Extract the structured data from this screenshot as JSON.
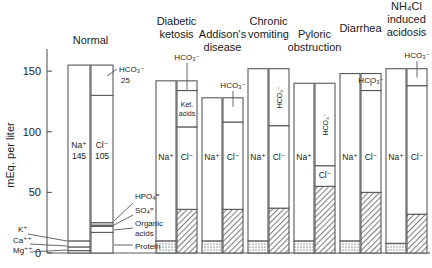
{
  "axis": {
    "title": "mEq. per liter",
    "ticks": [
      0,
      50,
      100,
      150
    ],
    "max": 160,
    "min": 0
  },
  "labels": {
    "hco3": "HCO₃⁻",
    "na": "Na⁺",
    "cl": "Cl⁻",
    "k": "K⁺",
    "ca": "Ca⁺⁺",
    "mg": "Mg⁺⁺",
    "hpo4": "HPO₄⁼",
    "so4": "SO₄⁼",
    "organic_acids": "Organic acids",
    "protein": "Protein",
    "ket_acids": "Ket. acids",
    "na_value": "145",
    "cl_value": "105",
    "hco3_value": "25"
  },
  "chart_data": {
    "type": "bar",
    "title": "",
    "xlabel": "",
    "ylabel": "mEq. per liter",
    "ylim": [
      0,
      160
    ],
    "categories": [
      "Normal",
      "Diabetic ketosis",
      "Addison's disease",
      "Chronic vomiting",
      "Pyloric obstruction",
      "Diarrhea",
      "NH₄Cl induced acidosis"
    ],
    "columns": [
      {
        "name": "Normal",
        "title_lines": [
          "Normal"
        ],
        "cation_total": 155,
        "anion_total": 155,
        "cation_segments": [
          {
            "label": "Na⁺",
            "value": 145,
            "fill": "white"
          },
          {
            "label": "K⁺",
            "value": 5,
            "fill": "white"
          },
          {
            "label": "Ca⁺⁺",
            "value": 3,
            "fill": "white"
          },
          {
            "label": "Mg⁺⁺",
            "value": 2,
            "fill": "white"
          }
        ],
        "anion_segments": [
          {
            "label": "HCO₃⁻",
            "value": 25,
            "fill": "white"
          },
          {
            "label": "Cl⁻",
            "value": 105,
            "fill": "white"
          },
          {
            "label": "HPO₄⁼",
            "value": 2,
            "fill": "white"
          },
          {
            "label": "SO₄⁼",
            "value": 1,
            "fill": "white"
          },
          {
            "label": "Organic acids",
            "value": 5,
            "fill": "white"
          },
          {
            "label": "Protein",
            "value": 17,
            "fill": "white"
          }
        ]
      },
      {
        "name": "Diabetic ketosis",
        "title_lines": [
          "Diabetic",
          "ketosis"
        ],
        "cation_total": 142,
        "anion_total": 142,
        "cation_segments": [
          {
            "label": "Na⁺",
            "value": 132,
            "fill": "white"
          },
          {
            "label": "other",
            "value": 10,
            "fill": "dots"
          }
        ],
        "anion_segments": [
          {
            "label": "HCO₃⁻",
            "value": 8,
            "fill": "white"
          },
          {
            "label": "Ket. acids",
            "value": 30,
            "fill": "white"
          },
          {
            "label": "Cl⁻",
            "value": 68,
            "fill": "white"
          },
          {
            "label": "residual",
            "value": 36,
            "fill": "hatch"
          }
        ]
      },
      {
        "name": "Addison's disease",
        "title_lines": [
          "Addison's",
          "disease"
        ],
        "cation_total": 128,
        "anion_total": 128,
        "cation_segments": [
          {
            "label": "Na⁺",
            "value": 118,
            "fill": "white"
          },
          {
            "label": "other",
            "value": 10,
            "fill": "dots"
          }
        ],
        "anion_segments": [
          {
            "label": "HCO₃⁻",
            "value": 20,
            "fill": "white"
          },
          {
            "label": "Cl⁻",
            "value": 72,
            "fill": "white"
          },
          {
            "label": "residual",
            "value": 36,
            "fill": "hatch"
          }
        ]
      },
      {
        "name": "Chronic vomiting",
        "title_lines": [
          "Chronic",
          "vomiting"
        ],
        "cation_total": 152,
        "anion_total": 152,
        "cation_segments": [
          {
            "label": "Na⁺",
            "value": 142,
            "fill": "white"
          },
          {
            "label": "other",
            "value": 10,
            "fill": "dots"
          }
        ],
        "anion_segments": [
          {
            "label": "HCO₃⁻",
            "value": 47,
            "fill": "white"
          },
          {
            "label": "Cl⁻",
            "value": 68,
            "fill": "white"
          },
          {
            "label": "residual",
            "value": 37,
            "fill": "hatch"
          }
        ]
      },
      {
        "name": "Pyloric obstruction",
        "title_lines": [
          "Pyloric",
          "obstruction"
        ],
        "cation_total": 140,
        "anion_total": 140,
        "cation_segments": [
          {
            "label": "Na⁺",
            "value": 130,
            "fill": "white"
          },
          {
            "label": "other",
            "value": 10,
            "fill": "dots"
          }
        ],
        "anion_segments": [
          {
            "label": "HCO₃⁻",
            "value": 68,
            "fill": "white"
          },
          {
            "label": "Cl⁻",
            "value": 17,
            "fill": "white"
          },
          {
            "label": "residual",
            "value": 55,
            "fill": "hatch"
          }
        ]
      },
      {
        "name": "Diarrhea",
        "title_lines": [
          "Diarrhea"
        ],
        "cation_total": 148,
        "anion_total": 148,
        "cation_segments": [
          {
            "label": "Na⁺",
            "value": 138,
            "fill": "white"
          },
          {
            "label": "other",
            "value": 10,
            "fill": "dots"
          }
        ],
        "anion_segments": [
          {
            "label": "HCO₃⁻",
            "value": 14,
            "fill": "white"
          },
          {
            "label": "Cl⁻",
            "value": 84,
            "fill": "white"
          },
          {
            "label": "residual",
            "value": 50,
            "fill": "hatch"
          }
        ]
      },
      {
        "name": "NH4Cl induced acidosis",
        "title_lines": [
          "NH₄Cl",
          "induced",
          "acidosis"
        ],
        "cation_total": 152,
        "anion_total": 152,
        "cation_segments": [
          {
            "label": "Na⁺",
            "value": 144,
            "fill": "white"
          },
          {
            "label": "other",
            "value": 8,
            "fill": "dots"
          }
        ],
        "anion_segments": [
          {
            "label": "HCO₃⁻",
            "value": 14,
            "fill": "white"
          },
          {
            "label": "Cl⁻",
            "value": 106,
            "fill": "white"
          },
          {
            "label": "residual",
            "value": 32,
            "fill": "hatch"
          }
        ]
      }
    ]
  }
}
